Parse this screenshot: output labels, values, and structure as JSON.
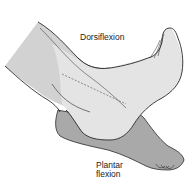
{
  "figure": {
    "labels": {
      "dorsiflexion": "Dorsiflexion",
      "plantar_line1": "Plantar",
      "plantar_line2": "flexion"
    },
    "colors": {
      "leg_fill": "#d2d2d2",
      "dorsiflexed_foot_fill": "#e4e4e4",
      "plantar_flexed_foot_fill": "#a9a9a9",
      "outline": "#2a2a2a",
      "background": "#ffffff"
    }
  }
}
